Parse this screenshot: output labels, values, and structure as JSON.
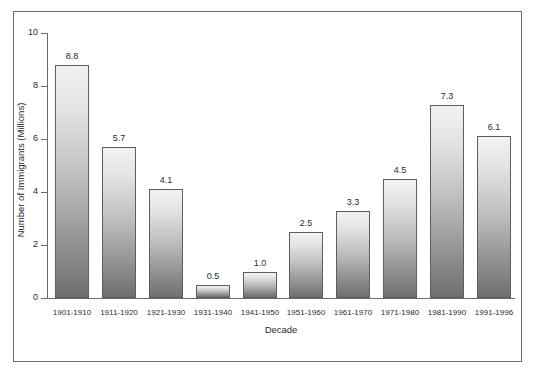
{
  "chart_data": {
    "type": "bar",
    "title": "",
    "subtitle": "",
    "xlabel": "Decade",
    "ylabel": "Number of Immigrants (Millions)",
    "categories": [
      "1901-1910",
      "1911-1920",
      "1921-1930",
      "1931-1940",
      "1941-1950",
      "1951-1960",
      "1961-1970",
      "1971-1980",
      "1981-1990",
      "1991-1996"
    ],
    "values": [
      8.8,
      5.7,
      4.1,
      0.5,
      1.0,
      2.5,
      3.3,
      4.5,
      7.3,
      6.1
    ],
    "value_labels": [
      "8.8",
      "5.7",
      "4.1",
      "0.5",
      "1.0",
      "2.5",
      "3.3",
      "4.5",
      "7.3",
      "6.1"
    ],
    "ylim": [
      0,
      10
    ],
    "yticks": [
      0,
      2,
      4,
      6,
      8,
      10
    ],
    "ytick_labels": [
      "0",
      "2",
      "4",
      "6",
      "8",
      "10"
    ],
    "grid": false,
    "legend": false,
    "legend_position": "none",
    "bar_fill_top_color": "#f2f2f2",
    "bar_fill_bottom_color": "#6f6f6f",
    "bar_border_color": "#5d5d5d",
    "axis_color": "#6b6b6b",
    "frame_color": "#6b6b6b",
    "background_color": "#ffffff",
    "text_color": "#2b2b2b"
  }
}
